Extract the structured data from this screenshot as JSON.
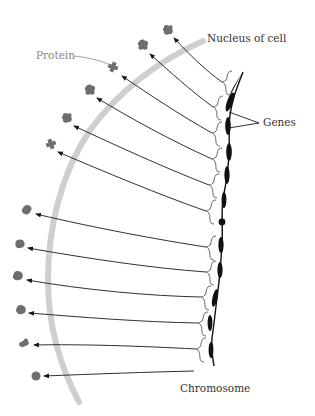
{
  "labels": {
    "nucleus": "Nucleus of cell",
    "protein": "Protein",
    "genes": "Genes",
    "chromosome": "Chromosome"
  },
  "colors": {
    "membrane": "#cfcfcf",
    "protein": "#6e6e6e",
    "chromosome": "#111111",
    "arrow": "#1a1a1a",
    "bracket": "#555555",
    "label_dark": "#333333",
    "label_gray": "#8a8a8a"
  },
  "diagram": {
    "proteins": [
      {
        "x": 168,
        "y": 30,
        "shape": "blob"
      },
      {
        "x": 143,
        "y": 45,
        "shape": "blob"
      },
      {
        "x": 113,
        "y": 67,
        "shape": "cross"
      },
      {
        "x": 90,
        "y": 90,
        "shape": "blob"
      },
      {
        "x": 67,
        "y": 118,
        "shape": "blob"
      },
      {
        "x": 51,
        "y": 144,
        "shape": "cross"
      },
      {
        "x": 27,
        "y": 210,
        "shape": "blob"
      },
      {
        "x": 20,
        "y": 244,
        "shape": "blob"
      },
      {
        "x": 18,
        "y": 276,
        "shape": "blob"
      },
      {
        "x": 21,
        "y": 310,
        "shape": "blob"
      },
      {
        "x": 24,
        "y": 343,
        "shape": "cross"
      },
      {
        "x": 36,
        "y": 376,
        "shape": "round"
      }
    ]
  }
}
